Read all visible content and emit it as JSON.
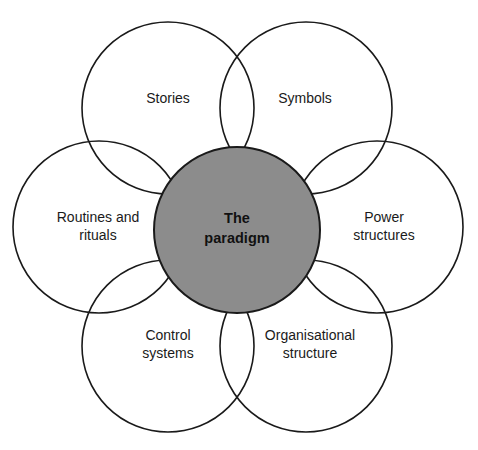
{
  "diagram": {
    "type": "cultural-web",
    "center": {
      "lines": [
        "The",
        "paradigm"
      ],
      "fill": "#8c8c8c",
      "cx": 237,
      "cy": 230,
      "r": 83
    },
    "elements": [
      {
        "id": "stories",
        "lines": [
          "Stories"
        ],
        "cx": 168,
        "cy": 108,
        "r": 86
      },
      {
        "id": "symbols",
        "lines": [
          "Symbols"
        ],
        "cx": 306,
        "cy": 108,
        "r": 86
      },
      {
        "id": "power-structures",
        "lines": [
          "Power",
          "structures"
        ],
        "cx": 377,
        "cy": 227,
        "r": 86
      },
      {
        "id": "organisational-structure",
        "lines": [
          "Organisational",
          "structure"
        ],
        "cx": 306,
        "cy": 346,
        "r": 86
      },
      {
        "id": "control-systems",
        "lines": [
          "Control",
          "systems"
        ],
        "cx": 168,
        "cy": 346,
        "r": 86
      },
      {
        "id": "routines-and-rituals",
        "lines": [
          "Routines and",
          "rituals"
        ],
        "cx": 99,
        "cy": 227,
        "r": 86
      }
    ],
    "stroke_color": "#1a1a1a"
  }
}
